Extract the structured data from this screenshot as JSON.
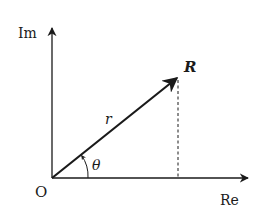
{
  "diagram": {
    "type": "complex-plane-phasor",
    "axes": {
      "x_label": "Re",
      "y_label": "Im",
      "origin_label": "O"
    },
    "vector": {
      "tip_label": "R",
      "magnitude_label": "r",
      "angle_label": "θ"
    },
    "colors": {
      "stroke": "#1a1a1a",
      "background": "#ffffff"
    }
  }
}
